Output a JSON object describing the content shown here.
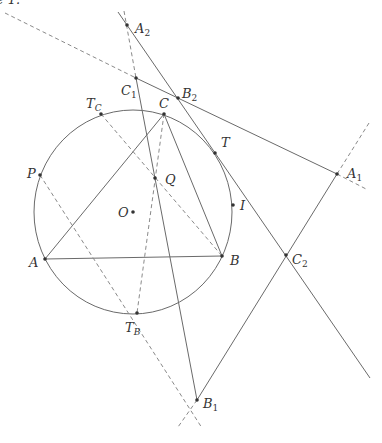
{
  "figure": {
    "caption_fragment": "e 1.",
    "circle": {
      "cx": 133,
      "cy": 212,
      "rx": 99,
      "ry": 102
    },
    "points": [
      {
        "id": "A2",
        "name": "A",
        "sub": "2",
        "x": 127,
        "y": 25,
        "lx": 135,
        "ly": 33
      },
      {
        "id": "C1",
        "name": "C",
        "sub": "1",
        "x": 136,
        "y": 78,
        "lx": 121,
        "ly": 95
      },
      {
        "id": "B2",
        "name": "B",
        "sub": "2",
        "x": 178,
        "y": 98,
        "lx": 182,
        "ly": 98
      },
      {
        "id": "TC",
        "name": "T",
        "sub": "C",
        "x": 101,
        "y": 114,
        "lx": 86,
        "ly": 108
      },
      {
        "id": "C",
        "name": "C",
        "sub": "",
        "x": 164,
        "y": 114,
        "lx": 159,
        "ly": 108
      },
      {
        "id": "T",
        "name": "T",
        "sub": "",
        "x": 215,
        "y": 153,
        "lx": 221,
        "ly": 147
      },
      {
        "id": "A1",
        "name": "A",
        "sub": "1",
        "x": 337,
        "y": 174,
        "lx": 347,
        "ly": 178
      },
      {
        "id": "P",
        "name": "P",
        "sub": "",
        "x": 40,
        "y": 175,
        "lx": 27,
        "ly": 178
      },
      {
        "id": "Q",
        "name": "Q",
        "sub": "",
        "x": 155,
        "y": 178,
        "lx": 165,
        "ly": 184
      },
      {
        "id": "O",
        "name": "O",
        "sub": "",
        "x": 133,
        "y": 212,
        "lx": 118,
        "ly": 217
      },
      {
        "id": "I",
        "name": "I",
        "sub": "",
        "x": 233,
        "y": 205,
        "lx": 240,
        "ly": 210
      },
      {
        "id": "A",
        "name": "A",
        "sub": "",
        "x": 45,
        "y": 259,
        "lx": 29,
        "ly": 267
      },
      {
        "id": "B",
        "name": "B",
        "sub": "",
        "x": 222,
        "y": 256,
        "lx": 230,
        "ly": 265
      },
      {
        "id": "C2",
        "name": "C",
        "sub": "2",
        "x": 286,
        "y": 255,
        "lx": 292,
        "ly": 264
      },
      {
        "id": "TB",
        "name": "T",
        "sub": "B",
        "x": 137,
        "y": 313,
        "lx": 125,
        "ly": 332
      },
      {
        "id": "B1",
        "name": "B",
        "sub": "1",
        "x": 197,
        "y": 400,
        "lx": 203,
        "ly": 408
      }
    ],
    "solid_lines": [
      {
        "id": "line-A2-C2",
        "x1": 118,
        "y1": 12,
        "x2": 370,
        "y2": 378
      },
      {
        "id": "line-C1-A1",
        "x1": 136,
        "y1": 78,
        "x2": 337,
        "y2": 174
      },
      {
        "id": "line-A1-B1",
        "x1": 337,
        "y1": 174,
        "x2": 197,
        "y2": 400
      },
      {
        "id": "line-C1-B1",
        "x1": 136,
        "y1": 78,
        "x2": 197,
        "y2": 400
      },
      {
        "id": "side-AB",
        "x1": 45,
        "y1": 259,
        "x2": 222,
        "y2": 256
      },
      {
        "id": "side-BC",
        "x1": 222,
        "y1": 256,
        "x2": 164,
        "y2": 114
      },
      {
        "id": "side-CA",
        "x1": 164,
        "y1": 114,
        "x2": 45,
        "y2": 259
      }
    ],
    "dashed_lines": [
      {
        "id": "dash-tangent-C1",
        "x1": 5,
        "y1": 13,
        "x2": 136,
        "y2": 78
      },
      {
        "id": "dash-A2-C1",
        "x1": 124,
        "y1": 11,
        "x2": 136,
        "y2": 78
      },
      {
        "id": "dash-A1-ext",
        "x1": 369,
        "y1": 123,
        "x2": 337,
        "y2": 174
      },
      {
        "id": "dash-A1-ext2",
        "x1": 337,
        "y1": 174,
        "x2": 368,
        "y2": 190
      },
      {
        "id": "dash-C-TB",
        "x1": 164,
        "y1": 114,
        "x2": 137,
        "y2": 313
      },
      {
        "id": "dash-TC-B",
        "x1": 101,
        "y1": 114,
        "x2": 222,
        "y2": 256
      },
      {
        "id": "dash-P-B1",
        "x1": 40,
        "y1": 175,
        "x2": 202,
        "y2": 428
      },
      {
        "id": "dash-B1-ext",
        "x1": 197,
        "y1": 400,
        "x2": 178,
        "y2": 427
      }
    ]
  }
}
